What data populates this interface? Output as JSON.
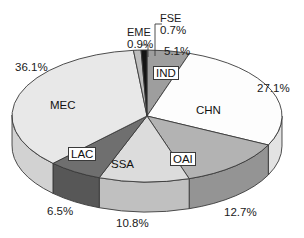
{
  "chart_data": {
    "type": "pie",
    "title": "",
    "subtitle": "",
    "xlabel": "",
    "ylabel": "",
    "legend_position": "none",
    "grid": false,
    "three_d": true,
    "start_angle_deg": -90,
    "direction": "clockwise",
    "categories": [
      "IND",
      "CHN",
      "OAI",
      "SSA",
      "LAC",
      "MEC",
      "EME",
      "FSE"
    ],
    "values": [
      5.1,
      27.1,
      12.7,
      10.8,
      6.5,
      36.1,
      0.9,
      0.7
    ],
    "value_suffix": "%",
    "total": 99.9,
    "slices": [
      {
        "label": "IND",
        "value": 5.1,
        "value_text": "5.1%",
        "color": "#9e9e9e",
        "side_color": "#7e7e7e",
        "label_placement": "inside-boxed",
        "pct_placement": "outside-top"
      },
      {
        "label": "CHN",
        "value": 27.1,
        "value_text": "27.1%",
        "color": "#fdfdfd",
        "side_color": "#e3e3e3",
        "label_placement": "inside-plain",
        "pct_placement": "outside-right"
      },
      {
        "label": "OAI",
        "value": 12.7,
        "value_text": "12.7%",
        "color": "#b3b3b3",
        "side_color": "#949494",
        "label_placement": "inside-boxed",
        "pct_placement": "outside-bottom-right"
      },
      {
        "label": "SSA",
        "value": 10.8,
        "value_text": "10.8%",
        "color": "#dcdcdc",
        "side_color": "#c0c0c0",
        "label_placement": "inside-plain",
        "pct_placement": "outside-bottom"
      },
      {
        "label": "LAC",
        "value": 6.5,
        "value_text": "6.5%",
        "color": "#6f6f6f",
        "side_color": "#575757",
        "label_placement": "inside-boxed",
        "pct_placement": "outside-bottom-left"
      },
      {
        "label": "MEC",
        "value": 36.1,
        "value_text": "36.1%",
        "color": "#e8e8e8",
        "side_color": "#d2d2d2",
        "label_placement": "inside-plain",
        "pct_placement": "outside-left"
      },
      {
        "label": "EME",
        "value": 0.9,
        "value_text": "0.9%",
        "color": "#bdbdbd",
        "side_color": "#9c9c9c",
        "label_placement": "leader-top-left",
        "pct_placement": "leader-top-left"
      },
      {
        "label": "FSE",
        "value": 0.7,
        "value_text": "0.7%",
        "color": "#141414",
        "side_color": "#0c0c0c",
        "label_placement": "leader-top-right",
        "pct_placement": "leader-top-right"
      }
    ]
  },
  "labels": {
    "eme_name": "EME",
    "eme_pct": "0.9%",
    "fse_name": "FSE",
    "fse_pct": "0.7%",
    "ind_name": "IND",
    "ind_pct": "5.1%",
    "chn_name": "CHN",
    "chn_pct": "27.1%",
    "oai_name": "OAI",
    "oai_pct": "12.7%",
    "ssa_name": "SSA",
    "ssa_pct": "10.8%",
    "lac_name": "LAC",
    "lac_pct": "6.5%",
    "mec_name": "MEC",
    "mec_pct": "36.1%"
  },
  "colors": {
    "outline": "#3a3a3a",
    "text": "#1a1a1a",
    "background": "#ffffff"
  }
}
